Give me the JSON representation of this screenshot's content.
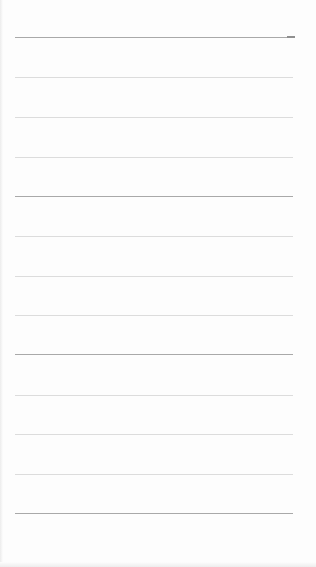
{
  "page": {
    "type": "ruled-sheet",
    "background_color": "#fdfdfd",
    "rule_colors": {
      "dark": "#a9a9a9",
      "light": "#dcdcdc"
    },
    "rule_left": 15,
    "rule_width": 278,
    "rules": [
      {
        "y": 37,
        "style": "dark",
        "tick": true
      },
      {
        "y": 77,
        "style": "light"
      },
      {
        "y": 117,
        "style": "light"
      },
      {
        "y": 157,
        "style": "light"
      },
      {
        "y": 196,
        "style": "dark"
      },
      {
        "y": 236,
        "style": "light"
      },
      {
        "y": 276,
        "style": "light"
      },
      {
        "y": 315,
        "style": "light"
      },
      {
        "y": 354,
        "style": "dark"
      },
      {
        "y": 395,
        "style": "light"
      },
      {
        "y": 434,
        "style": "light"
      },
      {
        "y": 474,
        "style": "light"
      },
      {
        "y": 513,
        "style": "dark"
      }
    ]
  }
}
